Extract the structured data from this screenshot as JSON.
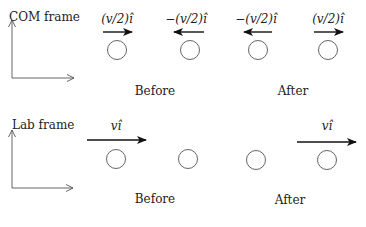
{
  "panels": [
    {
      "id": "com",
      "frame_label": "COM frame",
      "before_label": "Before",
      "after_label": "After",
      "velocities": [
        {
          "text": "(v/2)î",
          "direction": "right"
        },
        {
          "text": "−(v/2)î",
          "direction": "left"
        },
        {
          "text": "−(v/2)î",
          "direction": "left"
        },
        {
          "text": "(v/2)î",
          "direction": "right"
        }
      ]
    },
    {
      "id": "lab",
      "frame_label": "Lab frame",
      "before_label": "Before",
      "after_label": "After",
      "velocities": [
        {
          "text": "vî",
          "direction": "right"
        },
        {
          "text": "",
          "direction": "none"
        },
        {
          "text": "",
          "direction": "none"
        },
        {
          "text": "vî",
          "direction": "right"
        }
      ]
    }
  ],
  "colors": {
    "stroke": "#222222",
    "axis": "#555555",
    "circle": "#555555"
  }
}
